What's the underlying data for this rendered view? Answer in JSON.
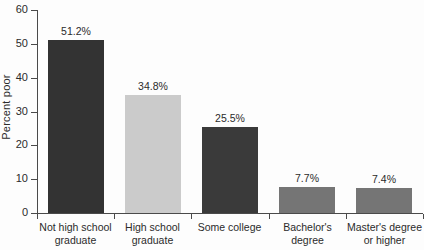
{
  "chart_data": {
    "type": "bar",
    "title": "",
    "xlabel": "",
    "ylabel": "Percent poor",
    "ylim": [
      0,
      60
    ],
    "grid": false,
    "legend": "none",
    "y_ticks": [
      0,
      10,
      20,
      30,
      40,
      50,
      60
    ],
    "y_tick_labels": [
      "0",
      "10",
      "20",
      "30",
      "40",
      "50",
      "60"
    ],
    "categories": [
      "Not high school\ngraduate",
      "High school\ngraduate",
      "Some college",
      "Bachelor's\ndegree",
      "Master's degree\nor higher"
    ],
    "values": [
      51.2,
      34.8,
      25.5,
      7.7,
      7.4
    ],
    "value_labels": [
      "51.2%",
      "34.8%",
      "25.5%",
      "7.7%",
      "7.4%"
    ],
    "bar_colors": [
      "#333333",
      "#cbcbcb",
      "#3a3a3a",
      "#757575",
      "#757575"
    ]
  }
}
